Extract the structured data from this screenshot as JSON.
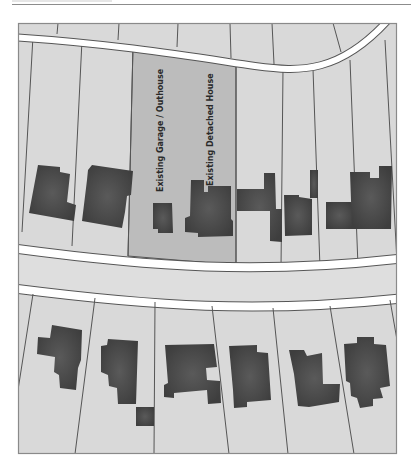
{
  "plan": {
    "type": "site-plan",
    "labels": {
      "garage": "Existing Garage / Outhouse",
      "house": "Existing Detached House"
    },
    "colors": {
      "ground": "#d9d9d9",
      "road_edge": "#ffffff",
      "road_surface": "#dedede",
      "highlighted_plot": "#bdbdbd",
      "building": "#4a4a4a",
      "boundary_line": "#555555",
      "frame": "#8a8a8a"
    },
    "counts": {
      "plots_north_row": 10,
      "plots_south_row": 7,
      "buildings_north_row": 8,
      "buildings_south_row": 7
    }
  }
}
